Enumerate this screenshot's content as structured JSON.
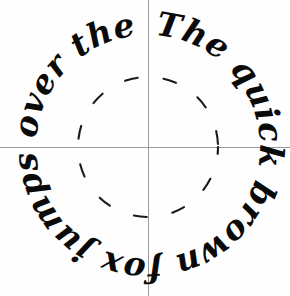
{
  "image": {
    "title": "Calligraphic circular pangram specimen",
    "background_color": "#fefefe",
    "ink_color": "#0a0a0a",
    "guide_color": "#9a9a9a",
    "width": 290,
    "height": 296
  },
  "artwork": {
    "pangram_text": "The quick brown fox jumps over the lazy dog.",
    "script_style": "italic calligraphy",
    "arrangement": "circular clockwise",
    "words": [
      "The",
      "quick",
      "brown",
      "fox",
      "jumps",
      "over",
      "the",
      "lazy",
      "dog."
    ]
  },
  "guides": {
    "crosshair": {
      "center_x": 148,
      "center_y": 147,
      "horizontal_label": "horizontal baseline guide",
      "vertical_label": "vertical center guide",
      "color": "#9a9a9a"
    },
    "dashed_circle": {
      "center_x": 148,
      "center_y": 147,
      "radius": 70,
      "dash_pattern": "13 26",
      "color": "#1b1b1b",
      "label": "dashed inner guide circle"
    },
    "text_circle": {
      "center_x": 148,
      "center_y": 147,
      "radius": 112,
      "label": "text baseline circle"
    }
  }
}
